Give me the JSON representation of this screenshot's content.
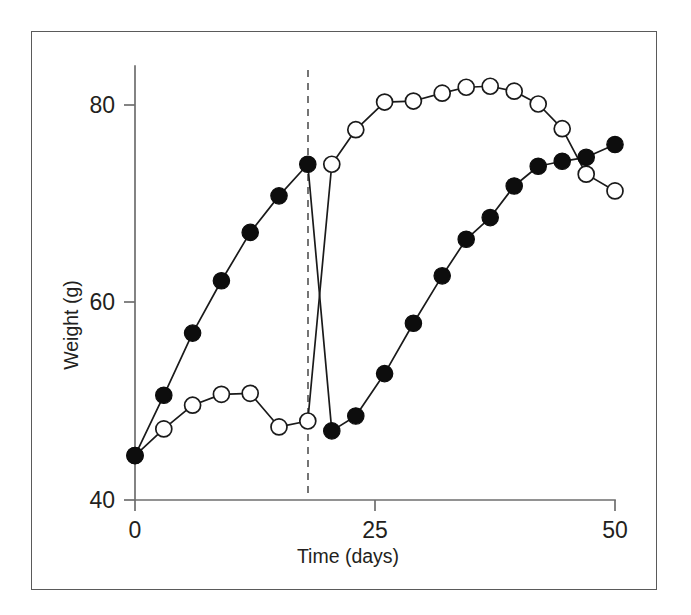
{
  "figure": {
    "background_color": "#ffffff",
    "frame_color": "#5a5a5a",
    "axis_color": "#6e6e6e",
    "ink_color": "#231f20"
  },
  "chart_data": {
    "type": "line",
    "title": "",
    "xlabel": "Time (days)",
    "ylabel": "Weight (g)",
    "xlim": [
      0,
      52
    ],
    "ylim": [
      40,
      85
    ],
    "xticks": [
      0,
      25,
      50
    ],
    "xtick_labels": [
      "0",
      "25",
      "50"
    ],
    "yticks": [
      40,
      60,
      80
    ],
    "ytick_labels": [
      "40",
      "60",
      "80"
    ],
    "grid": false,
    "legend": "none",
    "annotations": [
      {
        "name": "treatment-switch-line",
        "type": "vline",
        "x": 18,
        "style": "dashed",
        "label": ""
      }
    ],
    "series": [
      {
        "name": "filled-circles",
        "marker": "filled-circle",
        "marker_color": "#0d0d0d",
        "line_color": "#1a1a1a",
        "x": [
          0,
          3,
          6,
          9,
          12,
          15,
          18,
          20.5,
          23,
          26,
          29,
          32,
          34.5,
          37,
          39.5,
          42,
          44.5,
          47,
          50
        ],
        "y": [
          44.5,
          50.6,
          56.9,
          62.2,
          67.1,
          70.8,
          74.0,
          47.0,
          48.5,
          52.8,
          57.9,
          62.7,
          66.4,
          68.6,
          71.8,
          73.8,
          74.3,
          74.7,
          76.0
        ]
      },
      {
        "name": "open-circles",
        "marker": "open-circle",
        "marker_color": "#ffffff",
        "line_color": "#1a1a1a",
        "x": [
          0,
          3,
          6,
          9,
          12,
          15,
          18,
          20.5,
          23,
          26,
          29,
          32,
          34.5,
          37,
          39.5,
          42,
          44.5,
          47,
          50
        ],
        "y": [
          44.5,
          47.2,
          49.6,
          50.7,
          50.8,
          47.4,
          48.0,
          74.0,
          77.5,
          80.3,
          80.4,
          81.2,
          81.8,
          81.9,
          81.4,
          80.1,
          77.6,
          73.0,
          71.3
        ]
      }
    ]
  },
  "labels": {
    "y_axis_title": "Weight (g)",
    "x_axis_title": "Time (days)",
    "y_tick_80": "80",
    "y_tick_60": "60",
    "y_tick_40": "40",
    "x_tick_0": "0",
    "x_tick_25": "25",
    "x_tick_50": "50"
  }
}
